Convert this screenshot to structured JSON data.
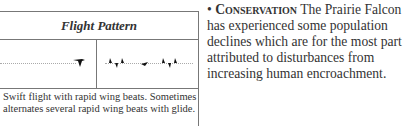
{
  "flight_table": {
    "header": "Flight Pattern",
    "description": "Swift flight with rapid wing beats. Sometimes alternates several rapid wing beats with glide."
  },
  "conservation": {
    "bullet": "•",
    "heading": "Conservation",
    "text": " The Prairie Falcon has experienced some population declines which are for the most part attributed to disturbances from increasing human encroachment."
  }
}
